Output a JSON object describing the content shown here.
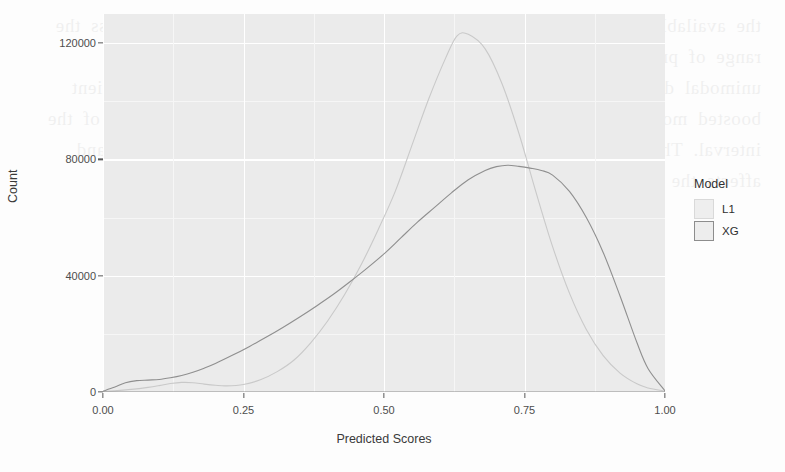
{
  "chart_data": {
    "type": "line",
    "title": "",
    "xlabel": "Predicted Scores",
    "ylabel": "Count",
    "xlim": [
      0.0,
      1.0
    ],
    "ylim": [
      0,
      130000
    ],
    "xticks": [
      0.0,
      0.25,
      0.5,
      0.75,
      1.0
    ],
    "xtick_labels": [
      "0.00",
      "0.25",
      "0.50",
      "0.75",
      "1.00"
    ],
    "yticks": [
      0,
      40000,
      80000,
      120000
    ],
    "ytick_labels": [
      "0",
      "40000",
      "80000",
      "120000"
    ],
    "grid": true,
    "legend_title": "Model",
    "legend_position": "right",
    "panel_background": "#ebebeb",
    "grid_color": "#ffffff",
    "series": [
      {
        "name": "L1",
        "color": "#c9c9c9",
        "x": [
          0.0,
          0.02,
          0.05,
          0.08,
          0.1,
          0.12,
          0.14,
          0.16,
          0.18,
          0.2,
          0.22,
          0.25,
          0.28,
          0.31,
          0.34,
          0.37,
          0.4,
          0.43,
          0.46,
          0.49,
          0.52,
          0.55,
          0.58,
          0.61,
          0.63,
          0.65,
          0.68,
          0.71,
          0.74,
          0.77,
          0.8,
          0.83,
          0.86,
          0.89,
          0.92,
          0.95,
          0.97,
          1.0
        ],
        "y": [
          200,
          400,
          900,
          1600,
          2200,
          2900,
          3300,
          3200,
          2700,
          2300,
          2100,
          2600,
          4200,
          7000,
          11000,
          17000,
          24500,
          33500,
          44000,
          56000,
          69000,
          85000,
          101000,
          115000,
          122500,
          123000,
          118000,
          106000,
          89000,
          69000,
          50000,
          34000,
          21500,
          12500,
          6500,
          2800,
          1400,
          300
        ]
      },
      {
        "name": "XG",
        "color": "#8f8f8f",
        "x": [
          0.0,
          0.02,
          0.04,
          0.06,
          0.08,
          0.1,
          0.12,
          0.14,
          0.16,
          0.18,
          0.2,
          0.23,
          0.26,
          0.29,
          0.32,
          0.35,
          0.38,
          0.41,
          0.44,
          0.47,
          0.5,
          0.53,
          0.56,
          0.59,
          0.62,
          0.65,
          0.68,
          0.7,
          0.72,
          0.74,
          0.76,
          0.78,
          0.8,
          0.83,
          0.86,
          0.89,
          0.92,
          0.95,
          0.97,
          1.0
        ],
        "y": [
          300,
          1600,
          3200,
          3900,
          4100,
          4300,
          4900,
          5700,
          6800,
          8200,
          9800,
          12600,
          15600,
          18800,
          22200,
          25800,
          29600,
          33600,
          38000,
          42600,
          47500,
          53000,
          58500,
          63500,
          68500,
          73000,
          76200,
          77500,
          78000,
          77600,
          77000,
          76200,
          74600,
          69000,
          60000,
          48000,
          33000,
          17000,
          8000,
          400
        ]
      }
    ]
  },
  "axes": {
    "y_title": "Count",
    "x_title": "Predicted Scores",
    "y_tick_labels": [
      "120000",
      "80000",
      "40000",
      "0"
    ],
    "x_tick_labels": [
      "0.00",
      "0.25",
      "0.50",
      "0.75",
      "1.00"
    ]
  },
  "legend": {
    "title": "Model",
    "items": [
      {
        "label": "L1",
        "key_color": "#eeeeee"
      },
      {
        "label": "XG",
        "key_color": "#ededed"
      }
    ]
  },
  "bleed_text": "the available scores and between the distributions of the two models across the range of predicted scores. While the L1 model produced a sharply peaked unimodal distribution centred near the middle of the score range, the gradient boosted model spread probability mass more evenly across the upper half of the interval. This difference reflects the regularisation applied during training and affects the calibration of each of the resulting ranking scores."
}
